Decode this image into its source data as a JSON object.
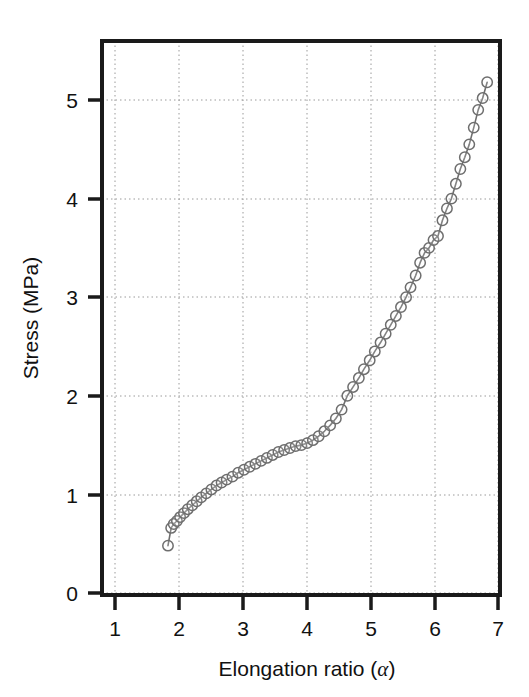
{
  "figure": {
    "background_color": "#ffffff",
    "frame_color": "#1a1a1a",
    "gridline_color": "#9a9a9a",
    "series_line_color": "#6e6e6e",
    "marker_edge_color": "#6e6e6e",
    "marker_fill_color": "#ffffff"
  },
  "axes": {
    "x": {
      "label_prefix": "Elongation ratio (",
      "label_symbol": "α",
      "label_suffix": ")",
      "label_full": "Elongation ratio (α)",
      "ticks": [
        "1",
        "2",
        "3",
        "4",
        "5",
        "6",
        "7"
      ],
      "range": [
        1,
        7
      ]
    },
    "y": {
      "label_full": "Stress (MPa)",
      "ticks": [
        "0",
        "1",
        "2",
        "3",
        "4",
        "5"
      ],
      "range": [
        0,
        5.6
      ]
    }
  },
  "chart_data": {
    "type": "line",
    "title": "",
    "subtitle": "",
    "xlabel": "Elongation ratio (α)",
    "ylabel": "Stress (MPa)",
    "xlim": [
      1,
      7
    ],
    "ylim": [
      0,
      5.6
    ],
    "xticks": [
      1,
      2,
      3,
      4,
      5,
      6,
      7
    ],
    "yticks": [
      0,
      1,
      2,
      3,
      4,
      5
    ],
    "grid": true,
    "grid_style": "dotted",
    "legend": null,
    "legend_position": "none",
    "marker": "open-circle",
    "annotations": [],
    "series": [
      {
        "name": "Stress vs elongation ratio",
        "x": [
          1.83,
          1.88,
          1.92,
          1.97,
          2.02,
          2.08,
          2.14,
          2.21,
          2.28,
          2.35,
          2.43,
          2.51,
          2.59,
          2.67,
          2.75,
          2.84,
          2.93,
          3.02,
          3.11,
          3.2,
          3.29,
          3.38,
          3.47,
          3.56,
          3.65,
          3.74,
          3.83,
          3.92,
          4.01,
          4.1,
          4.19,
          4.28,
          4.37,
          4.46,
          4.55,
          4.64,
          4.73,
          4.82,
          4.9,
          4.99,
          5.07,
          5.16,
          5.24,
          5.32,
          5.4,
          5.48,
          5.56,
          5.63,
          5.71,
          5.78,
          5.85,
          5.92,
          5.99,
          6.06,
          6.13,
          6.2,
          6.27,
          6.34,
          6.41,
          6.48,
          6.55,
          6.62,
          6.69,
          6.76,
          6.83
        ],
        "y": [
          0.48,
          0.66,
          0.7,
          0.73,
          0.77,
          0.81,
          0.85,
          0.89,
          0.93,
          0.97,
          1.01,
          1.05,
          1.09,
          1.12,
          1.15,
          1.18,
          1.22,
          1.25,
          1.28,
          1.31,
          1.34,
          1.37,
          1.4,
          1.43,
          1.45,
          1.47,
          1.49,
          1.5,
          1.52,
          1.55,
          1.59,
          1.64,
          1.7,
          1.77,
          1.86,
          2.0,
          2.09,
          2.18,
          2.27,
          2.36,
          2.45,
          2.54,
          2.63,
          2.72,
          2.81,
          2.9,
          3.0,
          3.1,
          3.22,
          3.35,
          3.45,
          3.5,
          3.58,
          3.62,
          3.78,
          3.9,
          4.0,
          4.15,
          4.3,
          4.42,
          4.55,
          4.72,
          4.9,
          5.02,
          5.18
        ]
      }
    ]
  }
}
